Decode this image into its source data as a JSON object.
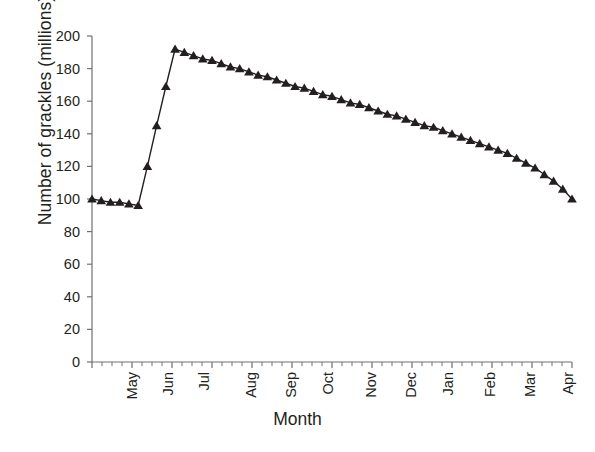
{
  "chart_data": {
    "type": "line",
    "title": "",
    "subtitle": "",
    "xlabel": "Month",
    "ylabel": "Number of grackles (millions)",
    "grid": false,
    "legend": null,
    "marker": "triangle",
    "line_color": "#231f20",
    "marker_color": "#231f20",
    "background": "#ffffff",
    "ylim": [
      0,
      200
    ],
    "ytick_labels": [
      "0",
      "20",
      "40",
      "60",
      "80",
      "100",
      "120",
      "140",
      "160",
      "180",
      "200"
    ],
    "ytick_values": [
      0,
      20,
      40,
      60,
      80,
      100,
      120,
      140,
      160,
      180,
      200
    ],
    "xtick_labels": [
      "May",
      "Jun",
      "Jul",
      "Aug",
      "Sep",
      "Oct",
      "Nov",
      "Dec",
      "Jan",
      "Feb",
      "Mar",
      "Apr",
      "May"
    ],
    "x_minor_ticks_per_month": 4,
    "x_note": "Weekly samples spanning May through the following May",
    "x": [
      0,
      1,
      2,
      3,
      4,
      5,
      6,
      7,
      8,
      9,
      10,
      11,
      12,
      13,
      14,
      15,
      16,
      17,
      18,
      19,
      20,
      21,
      22,
      23,
      24,
      25,
      26,
      27,
      28,
      29,
      30,
      31,
      32,
      33,
      34,
      35,
      36,
      37,
      38,
      39,
      40,
      41,
      42,
      43,
      44,
      45,
      46,
      47,
      48,
      49,
      50,
      51,
      52
    ],
    "values": [
      100,
      99,
      98,
      98,
      97,
      96,
      120,
      145,
      169,
      192,
      190,
      188,
      186,
      185,
      183,
      181,
      180,
      178,
      176,
      175,
      173,
      171,
      169,
      168,
      166,
      164,
      163,
      161,
      159,
      158,
      156,
      154,
      152,
      151,
      149,
      147,
      145,
      144,
      142,
      140,
      138,
      136,
      134,
      132,
      130,
      128,
      125,
      122,
      119,
      115,
      111,
      106,
      100
    ],
    "peak_value": 192,
    "start_value": 100,
    "end_value": 100,
    "min_value": 96
  }
}
